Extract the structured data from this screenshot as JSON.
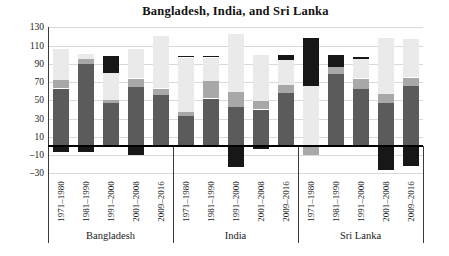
{
  "chart_data": {
    "type": "bar",
    "variant": "stacked-column-with-negatives",
    "title": "Bangladesh, India, and Sri Lanka",
    "legend": "none",
    "grid": "horizontal",
    "ylim": [
      -30,
      130
    ],
    "y_ticks": [
      {
        "label": "130",
        "value": 130
      },
      {
        "label": "110",
        "value": 110
      },
      {
        "label": "90",
        "value": 90
      },
      {
        "label": "70",
        "value": 70
      },
      {
        "label": "50",
        "value": 50
      },
      {
        "label": "30",
        "value": 30
      },
      {
        "label": "10",
        "value": 10
      },
      {
        "label": "–10",
        "value": -10
      },
      {
        "label": "–30",
        "value": -30
      }
    ],
    "groups": [
      "Bangladesh",
      "India",
      "Sri Lanka"
    ],
    "periods": [
      "1971–1980",
      "1981–1990",
      "1991–2000",
      "2001–2008",
      "2009–2016"
    ],
    "categories": [
      "Bangladesh 1971–1980",
      "Bangladesh 1981–1990",
      "Bangladesh 1991–2000",
      "Bangladesh 2001–2008",
      "Bangladesh 2009–2016",
      "India 1971–1980",
      "India 1981–1990",
      "India 1991–2000",
      "India 2001–2008",
      "India 2009–2016",
      "Sri Lanka 1971–1980",
      "Sri Lanka 1981–1990",
      "Sri Lanka 1991–2000",
      "Sri Lanka 2001–2008",
      "Sri Lanka 2009–2016"
    ],
    "series": [
      {
        "name": "dark-gray",
        "color": "#5b5b5b",
        "values": [
          63,
          90,
          47,
          65,
          56,
          33,
          52,
          43,
          40,
          58,
          0,
          79,
          63,
          47,
          66
        ]
      },
      {
        "name": "medium-gray",
        "color": "#a8a8a8",
        "values": [
          9,
          5,
          4,
          9,
          7,
          4,
          19,
          16,
          9,
          9,
          -10,
          8,
          11,
          10,
          9
        ]
      },
      {
        "name": "light-gray",
        "color": "#eaeaea",
        "values": [
          34,
          6,
          29,
          32,
          58,
          60,
          26,
          64,
          51,
          27,
          66,
          0,
          21,
          61,
          42
        ]
      },
      {
        "name": "black",
        "color": "#171717",
        "values": [
          -7,
          -7,
          19,
          -10,
          0,
          2,
          2,
          -23,
          -3,
          6,
          52,
          13,
          3,
          -26,
          -22
        ]
      }
    ],
    "colors": {
      "background": "#ffffff",
      "gridline": "#d9d9d9",
      "axis": "#000000",
      "separator": "#3a3a3a",
      "text": "#1a1a1a"
    }
  }
}
